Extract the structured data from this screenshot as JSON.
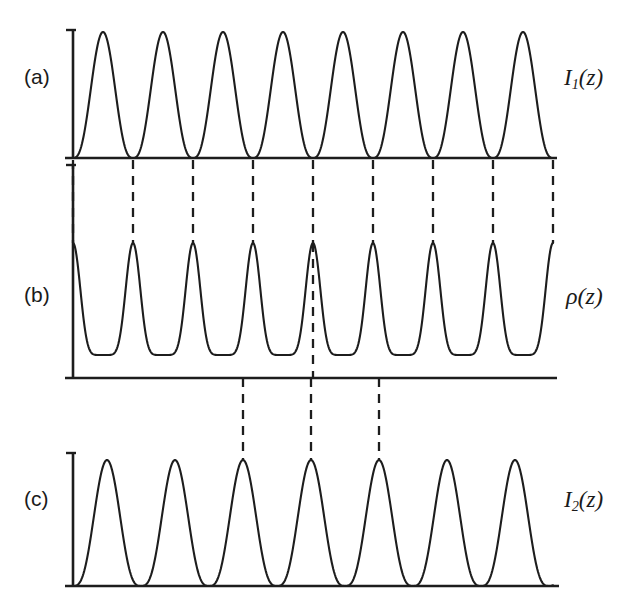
{
  "figure": {
    "background_color": "#ffffff",
    "ink_color": "#1d1d1d",
    "width": 632,
    "height": 613,
    "panels": [
      {
        "id": "a",
        "letter": "(a)",
        "signal_label": "I",
        "signal_sub": "1",
        "signal_arg": "(z)",
        "signal_label_full": "I1(z)"
      },
      {
        "id": "b",
        "letter": "(b)",
        "signal_label": "ρ",
        "signal_sub": "",
        "signal_arg": "(z)",
        "signal_label_full": "ρ(z)"
      },
      {
        "id": "c",
        "letter": "(c)",
        "signal_label": "I",
        "signal_sub": "2",
        "signal_arg": "(z)",
        "signal_label_full": "I2(z)"
      }
    ]
  },
  "chart_data": {
    "type": "line",
    "title": "",
    "xlabel": "",
    "ylabel": "",
    "grid": false,
    "legend": "none",
    "panels": [
      {
        "id": "a",
        "letter": "(a)",
        "label": "I1(z)",
        "waveform": "sin_squared",
        "x_start": 73,
        "x_end": 553,
        "baseline_y": 158,
        "peak_y": 32,
        "axis_top_y": 30,
        "period": 60,
        "phase": "node_at_x_start",
        "n_peaks": 8,
        "peak_width_factor": 0.86,
        "node_positions": [
          73,
          133,
          193,
          253,
          313,
          373,
          433,
          493,
          553
        ],
        "peak_positions": [
          103,
          163,
          223,
          283,
          343,
          403,
          463,
          523
        ],
        "peak_values": [
          1,
          1,
          1,
          1,
          1,
          1,
          1,
          1
        ],
        "ylim": [
          0,
          1
        ]
      },
      {
        "id": "b",
        "letter": "(b)",
        "label": "rho(z)",
        "waveform": "sharp_peaks",
        "x_start": 73,
        "x_end": 553,
        "baseline_y": 378,
        "peak_y": 243,
        "trough_y": 355,
        "axis_top_y": 165,
        "period": 60,
        "n_peaks": 9,
        "peak_sharpness": 7,
        "peak_positions": [
          73,
          133,
          193,
          253,
          313,
          373,
          433,
          493,
          553
        ],
        "peak_values": [
          1,
          1,
          1,
          1,
          1,
          1,
          1,
          1,
          1
        ],
        "trough_positions": [
          103,
          163,
          223,
          283,
          343,
          403,
          463,
          523
        ],
        "trough_value": 0.17,
        "ylim": [
          0,
          1
        ]
      },
      {
        "id": "c",
        "letter": "(c)",
        "label": "I2(z)",
        "waveform": "sin_squared",
        "x_start": 73,
        "x_end": 553,
        "baseline_y": 586,
        "peak_y": 460,
        "axis_top_y": 453,
        "period": 68,
        "phase": "node_at_x_start",
        "n_peaks": 7,
        "peak_width_factor": 0.78,
        "node_positions": [
          73,
          141,
          209,
          277,
          345,
          413,
          481,
          549
        ],
        "peak_positions": [
          107,
          175,
          243,
          311,
          379,
          447,
          515
        ],
        "peak_values": [
          1,
          1,
          1,
          1,
          1,
          1,
          1
        ],
        "ylim": [
          0,
          1
        ]
      }
    ],
    "guides": [
      {
        "group": "a-to-b",
        "from_panel": "a",
        "to_panel": "b",
        "style": "dashed",
        "y_top": 160,
        "y_bottom": 243,
        "x_positions": [
          73,
          133,
          193,
          253,
          313,
          373,
          433,
          493,
          553
        ]
      },
      {
        "group": "b-to-c",
        "from_panel": "b",
        "to_panel": "c",
        "style": "dashed",
        "y_top": 378,
        "y_bottom": 460,
        "x_positions": [
          243,
          311,
          379
        ]
      },
      {
        "group": "b-internal",
        "from_panel": "b",
        "to_panel": "b",
        "style": "dashed",
        "y_top": 243,
        "y_bottom": 378,
        "x_positions": [
          313
        ]
      }
    ],
    "label_positions": {
      "a_letter": {
        "x": 24,
        "y": 78
      },
      "b_letter": {
        "x": 24,
        "y": 296
      },
      "c_letter": {
        "x": 24,
        "y": 500
      },
      "a_signal": {
        "x": 564,
        "y": 78
      },
      "b_signal": {
        "x": 566,
        "y": 296
      },
      "c_signal": {
        "x": 564,
        "y": 500
      }
    }
  }
}
